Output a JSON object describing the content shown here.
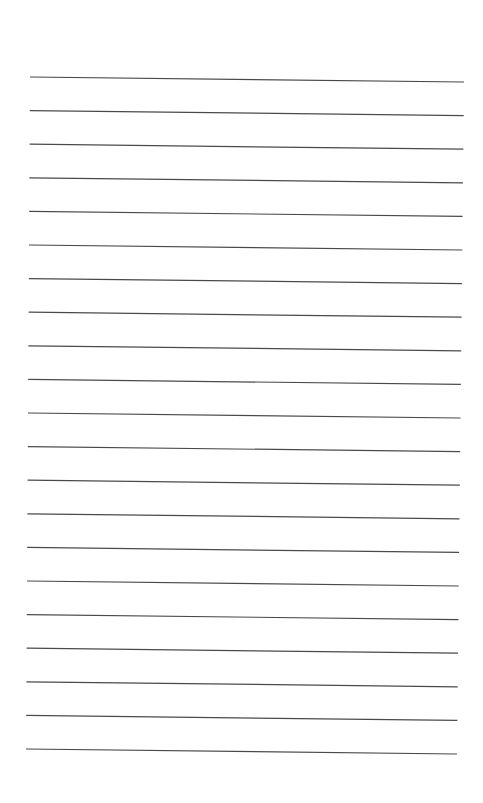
{
  "document": {
    "type": "lined-paper",
    "background": "#ffffff",
    "line_color": "#4a4a4a",
    "line_count": 21,
    "first_line_y_left": 77,
    "first_line_y_right": 82,
    "line_spacing": 33.6,
    "left_x_top": 30,
    "right_x_top": 464,
    "left_x_bottom": 26,
    "right_x_bottom": 457
  }
}
